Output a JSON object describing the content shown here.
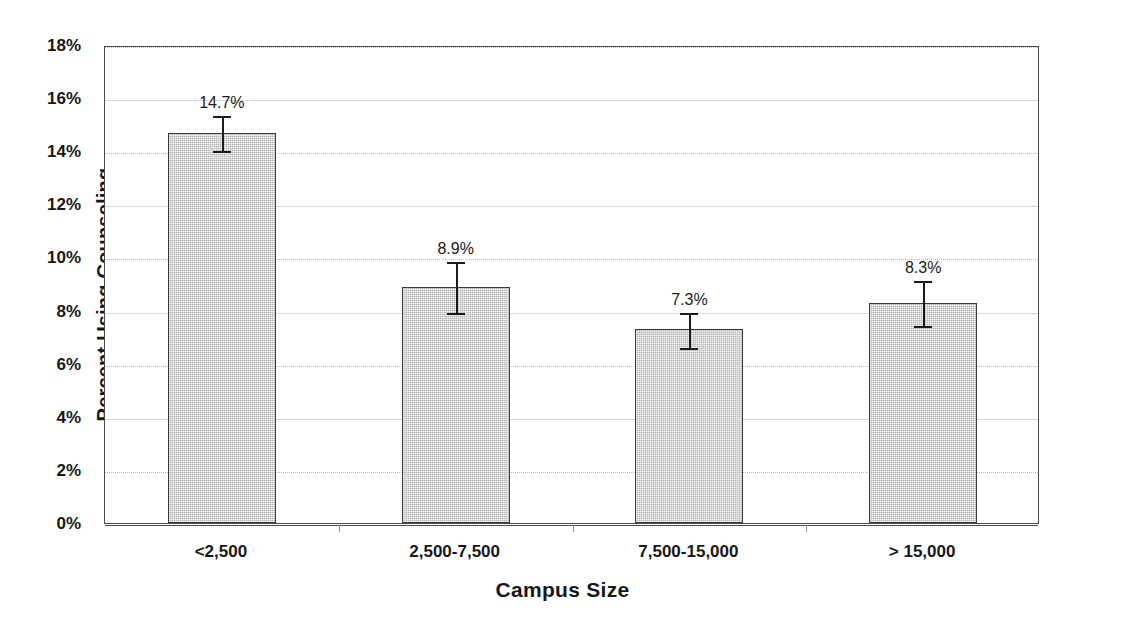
{
  "chart_data": {
    "type": "bar",
    "title": "",
    "xlabel": "Campus Size",
    "ylabel": "Percent Using Counseling",
    "categories": [
      "<2,500",
      "2,500-7,500",
      "7,500-15,000",
      "> 15,000"
    ],
    "values": [
      14.7,
      8.9,
      7.3,
      8.3
    ],
    "value_labels": [
      "14.7%",
      "8.9%",
      "7.3%",
      "8.3%"
    ],
    "error_bars": [
      {
        "value": 14.7,
        "minus": 0.7,
        "plus": 0.7
      },
      {
        "value": 8.9,
        "minus": 1.0,
        "plus": 1.0
      },
      {
        "value": 7.3,
        "minus": 0.7,
        "plus": 0.7
      },
      {
        "value": 8.3,
        "minus": 0.9,
        "plus": 0.9
      }
    ],
    "ylim": [
      0,
      18
    ],
    "ytick_values": [
      0,
      2,
      4,
      6,
      8,
      10,
      12,
      14,
      16,
      18
    ],
    "ytick_labels": [
      "0%",
      "2%",
      "4%",
      "6%",
      "8%",
      "10%",
      "12%",
      "14%",
      "16%",
      "18%"
    ],
    "grid": true,
    "legend": null,
    "series_name": "Percent Using Counseling",
    "colors": {
      "bar_fill": "#b5b5b5",
      "bar_border": "#3a3a3a",
      "error_bar": "#1b1b1b",
      "gridline": "#b9b9b9",
      "frame": "#4a4a4a",
      "text": "#171717",
      "background": "#ffffff"
    }
  }
}
